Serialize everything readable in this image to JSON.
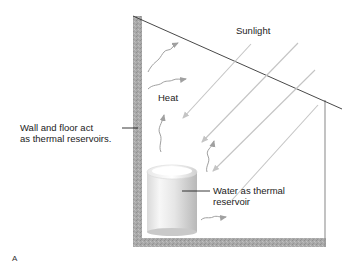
{
  "figure": {
    "panel_label": "A",
    "labels": {
      "sunlight": "Sunlight",
      "heat": "Heat",
      "wall_floor_line1": "Wall and floor act",
      "wall_floor_line2": "as thermal reservoirs.",
      "water_line1": "Water as thermal",
      "water_line2": "reservoir"
    },
    "colors": {
      "wall_fill": "#a8a8a8",
      "roof_line": "#333333",
      "sunlight_arrow": "#c4c4c4",
      "heat_arrow": "#999999",
      "cylinder_light": "#f2f2f2",
      "cylinder_dark": "#bdbdbd",
      "text": "#222222"
    }
  }
}
